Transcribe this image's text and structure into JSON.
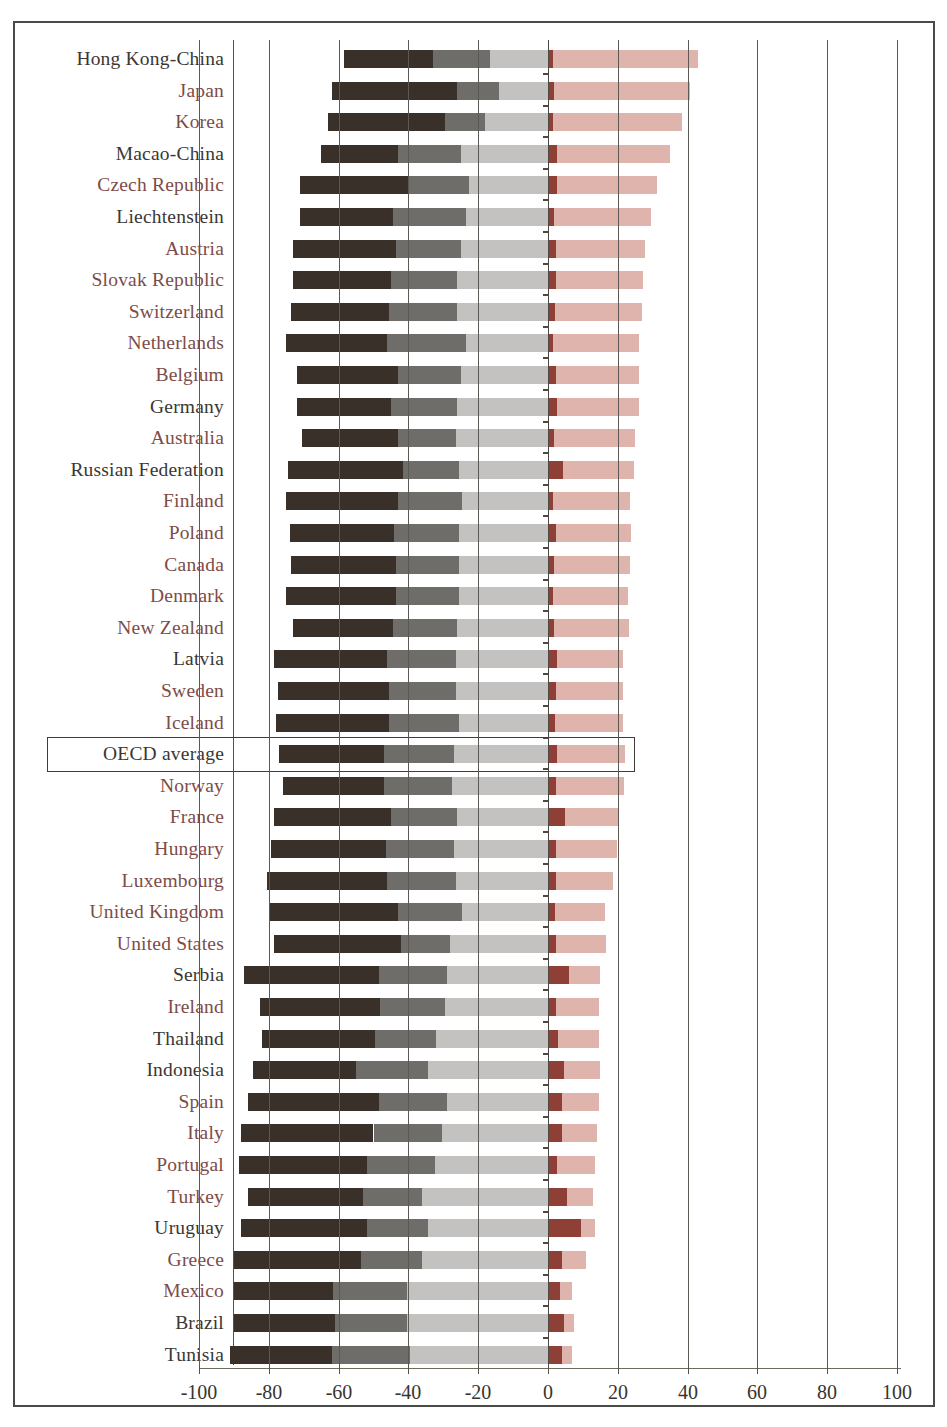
{
  "chart_data": {
    "type": "bar",
    "subtype": "diverging-stacked-bar",
    "title": "",
    "xlabel": "",
    "ylabel": "",
    "xlim": [
      -100,
      100
    ],
    "grid": true,
    "legend_position": "none",
    "xticks": [
      -100,
      -80,
      -60,
      -40,
      -20,
      0,
      20,
      40,
      60,
      80,
      100
    ],
    "xtick_labels": [
      "-100",
      "-80",
      "-60",
      "-40",
      "-20",
      "0",
      "20",
      "40",
      "60",
      "80",
      "100"
    ],
    "highlight_row": "OECD average",
    "series": [
      {
        "name": "level-2",
        "key": "l2",
        "color": "#3a302a",
        "direction": "negative"
      },
      {
        "name": "level-3",
        "key": "l3",
        "color": "#6f6d6a",
        "direction": "negative"
      },
      {
        "name": "level-4",
        "key": "l4",
        "color": "#c3c2c0",
        "direction": "negative"
      },
      {
        "name": "below-level-1",
        "key": "b1",
        "color": "#8e4036",
        "direction": "positive"
      },
      {
        "name": "level-1",
        "key": "l1",
        "color": "#dfb4ac",
        "direction": "positive"
      }
    ],
    "categories": [
      "Hong Kong-China",
      "Japan",
      "Korea",
      "Macao-China",
      "Czech Republic",
      "Liechtenstein",
      "Austria",
      "Slovak Republic",
      "Switzerland",
      "Netherlands",
      "Belgium",
      "Germany",
      "Australia",
      "Russian Federation",
      "Finland",
      "Poland",
      "Canada",
      "Denmark",
      "New Zealand",
      "Latvia",
      "Sweden",
      "Iceland",
      "OECD average",
      "Norway",
      "France",
      "Hungary",
      "Luxembourg",
      "United Kingdom",
      "United States",
      "Serbia",
      "Ireland",
      "Thailand",
      "Indonesia",
      "Spain",
      "Italy",
      "Portugal",
      "Turkey",
      "Uruguay",
      "Greece",
      "Mexico",
      "Brazil",
      "Tunisia"
    ],
    "rows": [
      {
        "label": "Hong Kong-China",
        "color": "dark",
        "l2": 25.5,
        "l3": 16.4,
        "l4": 16.6,
        "b1": 1.4,
        "l1": 41.6
      },
      {
        "label": "Japan",
        "color": "red",
        "l2": 36.0,
        "l3": 12.0,
        "l4": 14.0,
        "b1": 1.6,
        "l1": 39.0
      },
      {
        "label": "Korea",
        "color": "red",
        "l2": 33.5,
        "l3": 11.5,
        "l4": 18.0,
        "b1": 1.4,
        "l1": 37.0
      },
      {
        "label": "Macao-China",
        "color": "dark",
        "l2": 22.0,
        "l3": 18.0,
        "l4": 25.0,
        "b1": 2.5,
        "l1": 32.5
      },
      {
        "label": "Czech Republic",
        "color": "red",
        "l2": 31.0,
        "l3": 17.5,
        "l4": 22.5,
        "b1": 2.6,
        "l1": 28.5
      },
      {
        "label": "Liechtenstein",
        "color": "dark",
        "l2": 26.5,
        "l3": 21.0,
        "l4": 23.5,
        "b1": 1.6,
        "l1": 28.0
      },
      {
        "label": "Austria",
        "color": "red",
        "l2": 29.5,
        "l3": 18.5,
        "l4": 25.0,
        "b1": 2.2,
        "l1": 25.5
      },
      {
        "label": "Slovak Republic",
        "color": "red",
        "l2": 28.0,
        "l3": 19.0,
        "l4": 26.0,
        "b1": 2.2,
        "l1": 25.0
      },
      {
        "label": "Switzerland",
        "color": "red",
        "l2": 28.0,
        "l3": 19.5,
        "l4": 26.0,
        "b1": 1.9,
        "l1": 25.0
      },
      {
        "label": "Netherlands",
        "color": "red",
        "l2": 29.0,
        "l3": 22.5,
        "l4": 23.5,
        "b1": 1.5,
        "l1": 24.5
      },
      {
        "label": "Belgium",
        "color": "red",
        "l2": 29.0,
        "l3": 18.0,
        "l4": 25.0,
        "b1": 2.2,
        "l1": 24.0
      },
      {
        "label": "Germany",
        "color": "dark",
        "l2": 27.0,
        "l3": 19.0,
        "l4": 26.0,
        "b1": 2.5,
        "l1": 23.5
      },
      {
        "label": "Australia",
        "color": "red",
        "l2": 27.5,
        "l3": 16.5,
        "l4": 26.5,
        "b1": 1.8,
        "l1": 23.0
      },
      {
        "label": "Russian Federation",
        "color": "dark",
        "l2": 33.0,
        "l3": 16.0,
        "l4": 25.5,
        "b1": 4.2,
        "l1": 20.5
      },
      {
        "label": "Finland",
        "color": "red",
        "l2": 32.0,
        "l3": 18.5,
        "l4": 24.5,
        "b1": 1.5,
        "l1": 22.0
      },
      {
        "label": "Poland",
        "color": "red",
        "l2": 30.0,
        "l3": 18.5,
        "l4": 25.5,
        "b1": 2.2,
        "l1": 21.5
      },
      {
        "label": "Canada",
        "color": "red",
        "l2": 30.0,
        "l3": 18.0,
        "l4": 25.5,
        "b1": 1.6,
        "l1": 22.0
      },
      {
        "label": "Denmark",
        "color": "red",
        "l2": 31.5,
        "l3": 18.0,
        "l4": 25.5,
        "b1": 1.5,
        "l1": 21.5
      },
      {
        "label": "New Zealand",
        "color": "red",
        "l2": 28.5,
        "l3": 18.5,
        "l4": 26.0,
        "b1": 1.8,
        "l1": 21.5
      },
      {
        "label": "Latvia",
        "color": "dark",
        "l2": 32.5,
        "l3": 19.5,
        "l4": 26.5,
        "b1": 2.6,
        "l1": 19.0
      },
      {
        "label": "Sweden",
        "color": "red",
        "l2": 32.0,
        "l3": 19.0,
        "l4": 26.5,
        "b1": 2.4,
        "l1": 19.0
      },
      {
        "label": "Iceland",
        "color": "red",
        "l2": 32.5,
        "l3": 20.0,
        "l4": 25.5,
        "b1": 2.0,
        "l1": 19.5
      },
      {
        "label": "OECD average",
        "color": "dark",
        "l2": 30.0,
        "l3": 20.0,
        "l4": 27.0,
        "b1": 2.6,
        "l1": 19.5
      },
      {
        "label": "Norway",
        "color": "red",
        "l2": 29.0,
        "l3": 19.5,
        "l4": 27.5,
        "b1": 2.3,
        "l1": 19.5
      },
      {
        "label": "France",
        "color": "red",
        "l2": 33.5,
        "l3": 19.0,
        "l4": 26.0,
        "b1": 5.0,
        "l1": 15.0
      },
      {
        "label": "Hungary",
        "color": "red",
        "l2": 33.0,
        "l3": 19.5,
        "l4": 27.0,
        "b1": 2.3,
        "l1": 17.5
      },
      {
        "label": "Luxembourg",
        "color": "red",
        "l2": 34.5,
        "l3": 19.5,
        "l4": 26.5,
        "b1": 2.2,
        "l1": 16.5
      },
      {
        "label": "United Kingdom",
        "color": "red",
        "l2": 37.0,
        "l3": 18.5,
        "l4": 24.5,
        "b1": 1.9,
        "l1": 14.5
      },
      {
        "label": "United States",
        "color": "red",
        "l2": 36.5,
        "l3": 14.0,
        "l4": 28.0,
        "b1": 2.2,
        "l1": 14.5
      },
      {
        "label": "Serbia",
        "color": "dark",
        "l2": 38.5,
        "l3": 19.5,
        "l4": 29.0,
        "b1": 6.0,
        "l1": 9.0
      },
      {
        "label": "Ireland",
        "color": "red",
        "l2": 34.5,
        "l3": 18.5,
        "l4": 29.5,
        "b1": 2.2,
        "l1": 12.5
      },
      {
        "label": "Thailand",
        "color": "dark",
        "l2": 32.5,
        "l3": 17.5,
        "l4": 32.0,
        "b1": 3.0,
        "l1": 11.5
      },
      {
        "label": "Indonesia",
        "color": "dark",
        "l2": 29.5,
        "l3": 20.5,
        "l4": 34.5,
        "b1": 4.5,
        "l1": 10.5
      },
      {
        "label": "Spain",
        "color": "red",
        "l2": 37.5,
        "l3": 19.5,
        "l4": 29.0,
        "b1": 4.0,
        "l1": 10.5
      },
      {
        "label": "Italy",
        "color": "red",
        "l2": 38.0,
        "l3": 19.5,
        "l4": 30.5,
        "b1": 4.0,
        "l1": 10.0
      },
      {
        "label": "Portugal",
        "color": "red",
        "l2": 36.5,
        "l3": 19.5,
        "l4": 32.5,
        "b1": 2.5,
        "l1": 11.0
      },
      {
        "label": "Turkey",
        "color": "red",
        "l2": 33.0,
        "l3": 17.0,
        "l4": 36.0,
        "b1": 5.5,
        "l1": 7.5
      },
      {
        "label": "Uruguay",
        "color": "dark",
        "l2": 36.0,
        "l3": 17.5,
        "l4": 34.5,
        "b1": 9.5,
        "l1": 4.0
      },
      {
        "label": "Greece",
        "color": "red",
        "l2": 36.5,
        "l3": 17.5,
        "l4": 36.0,
        "b1": 4.0,
        "l1": 7.0
      },
      {
        "label": "Mexico",
        "color": "red",
        "l2": 28.5,
        "l3": 21.0,
        "l4": 40.5,
        "b1": 3.5,
        "l1": 3.5
      },
      {
        "label": "Brazil",
        "color": "dark",
        "l2": 29.0,
        "l3": 20.5,
        "l4": 40.5,
        "b1": 4.5,
        "l1": 3.0
      },
      {
        "label": "Tunisia",
        "color": "dark",
        "l2": 29.0,
        "l3": 22.5,
        "l4": 39.5,
        "b1": 4.0,
        "l1": 3.0
      }
    ]
  },
  "axis": {
    "tick_labels": [
      "-100",
      "-80",
      "-60",
      "-40",
      "-20",
      "0",
      "20",
      "40",
      "60",
      "80",
      "100"
    ]
  },
  "colors": {
    "level_2": "#3a302a",
    "level_3": "#6f6d6a",
    "level_4": "#c3c2c0",
    "below_level_1": "#8e4036",
    "level_1": "#dfb4ac",
    "label_dark": "#3a3734",
    "label_red": "#7d4c48",
    "grid": "#5c5954",
    "frame": "#4a4a46"
  }
}
